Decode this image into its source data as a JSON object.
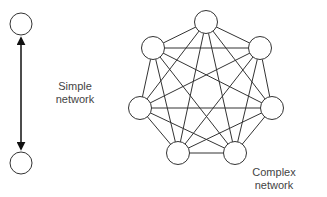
{
  "simple": {
    "label_line1": "Simple",
    "label_line2": "network",
    "nodes": [
      {
        "x": 21,
        "y": 24
      },
      {
        "x": 21,
        "y": 163
      }
    ]
  },
  "complex": {
    "label_line1": "Complex",
    "label_line2": "network",
    "nodes": [
      {
        "x": 206,
        "y": 22
      },
      {
        "x": 260,
        "y": 48
      },
      {
        "x": 272,
        "y": 108
      },
      {
        "x": 235,
        "y": 153
      },
      {
        "x": 178,
        "y": 153
      },
      {
        "x": 140,
        "y": 108
      },
      {
        "x": 153,
        "y": 48
      }
    ]
  },
  "colors": {
    "stroke": "#333333",
    "text": "#444444"
  }
}
